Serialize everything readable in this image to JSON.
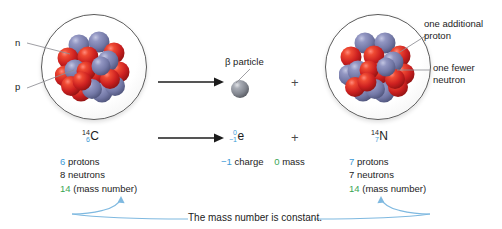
{
  "diagram": {
    "colors": {
      "proton_sphere": "#7b80ae",
      "neutron_sphere": "#cc2222",
      "beta_sphere": "#8b8f99",
      "blue_text": "#3c9ad6",
      "green_text": "#3aa655",
      "dark_text": "#1c1c1c",
      "leader_line": "#8e8e93",
      "curve_arrow": "#7fb9e0"
    }
  },
  "left_nucleus": {
    "labels": {
      "neutron": "n",
      "proton": "p"
    }
  },
  "beta": {
    "label": "β particle"
  },
  "right_nucleus": {
    "callouts": [
      {
        "line1": "one additional",
        "line2": "proton"
      },
      {
        "line1": "one fewer",
        "line2": "neutron"
      }
    ]
  },
  "equation": {
    "reactant": {
      "mass_number": "14",
      "atomic_number": "6",
      "symbol": "C"
    },
    "beta_particle": {
      "mass_number": "0",
      "charge_number": "−1",
      "symbol": "e"
    },
    "product": {
      "mass_number": "14",
      "atomic_number": "7",
      "symbol": "N"
    },
    "plus_sign": "+",
    "arrow": "→"
  },
  "left_stats": {
    "protons_value": "6",
    "protons_label": "protons",
    "neutrons_value": "8",
    "neutrons_label": "neutrons",
    "mass_value": "14",
    "mass_label": "(mass number)"
  },
  "center_stats": {
    "charge_value": "−1",
    "charge_label": "charge",
    "mass_value": "0",
    "mass_label": "mass"
  },
  "right_stats": {
    "protons_value": "7",
    "protons_label": "protons",
    "neutrons_value": "7",
    "neutrons_label": "neutrons",
    "mass_value": "14",
    "mass_label": "(mass number)"
  },
  "caption": {
    "text": "The mass number is constant."
  }
}
